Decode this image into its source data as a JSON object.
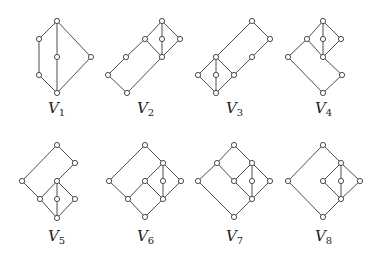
{
  "figure": {
    "width": 378,
    "height": 257,
    "colors": {
      "line": "#3a3a3a",
      "node_fill": "#ffffff",
      "text": "#222222"
    },
    "node_radius": 2.6,
    "lattices": [
      {
        "name": "V1",
        "label_main": "V",
        "label_sub": "1",
        "label_pos": [
          48,
          113
        ],
        "nodes": [
          [
            57,
            21
          ],
          [
            39,
            39
          ],
          [
            57,
            57
          ],
          [
            91,
            57
          ],
          [
            39,
            75
          ],
          [
            57,
            93
          ]
        ],
        "edges": [
          [
            0,
            1
          ],
          [
            0,
            2
          ],
          [
            0,
            3
          ],
          [
            1,
            4
          ],
          [
            4,
            5
          ],
          [
            2,
            5
          ],
          [
            3,
            5
          ]
        ]
      },
      {
        "name": "V2",
        "label_main": "V",
        "label_sub": "2",
        "label_pos": [
          137,
          113
        ],
        "nodes": [
          [
            162,
            21
          ],
          [
            145,
            39
          ],
          [
            162,
            39
          ],
          [
            180,
            39
          ],
          [
            162,
            57
          ],
          [
            126,
            57
          ],
          [
            108,
            75
          ],
          [
            127,
            93
          ]
        ],
        "edges": [
          [
            0,
            1
          ],
          [
            0,
            2
          ],
          [
            0,
            3
          ],
          [
            1,
            4
          ],
          [
            2,
            4
          ],
          [
            3,
            4
          ],
          [
            1,
            5
          ],
          [
            5,
            6
          ],
          [
            6,
            7
          ],
          [
            4,
            7
          ]
        ]
      },
      {
        "name": "V3",
        "label_main": "V",
        "label_sub": "3",
        "label_pos": [
          226,
          113
        ],
        "nodes": [
          [
            252,
            21
          ],
          [
            270,
            39
          ],
          [
            252,
            57
          ],
          [
            216,
            57
          ],
          [
            198,
            75
          ],
          [
            216,
            75
          ],
          [
            234,
            75
          ],
          [
            216,
            93
          ]
        ],
        "edges": [
          [
            0,
            1
          ],
          [
            1,
            2
          ],
          [
            2,
            6
          ],
          [
            0,
            3
          ],
          [
            3,
            4
          ],
          [
            3,
            5
          ],
          [
            3,
            6
          ],
          [
            4,
            7
          ],
          [
            5,
            7
          ],
          [
            6,
            7
          ]
        ]
      },
      {
        "name": "V4",
        "label_main": "V",
        "label_sub": "4",
        "label_pos": [
          315,
          113
        ],
        "nodes": [
          [
            323,
            21
          ],
          [
            307,
            39
          ],
          [
            323,
            39
          ],
          [
            341,
            39
          ],
          [
            323,
            57
          ],
          [
            288,
            57
          ],
          [
            342,
            75
          ],
          [
            323,
            93
          ]
        ],
        "edges": [
          [
            0,
            1
          ],
          [
            0,
            2
          ],
          [
            0,
            3
          ],
          [
            1,
            4
          ],
          [
            2,
            4
          ],
          [
            3,
            4
          ],
          [
            1,
            5
          ],
          [
            5,
            7
          ],
          [
            4,
            6
          ],
          [
            6,
            7
          ]
        ]
      },
      {
        "name": "V5",
        "label_main": "V",
        "label_sub": "5",
        "label_pos": [
          48,
          241
        ],
        "nodes": [
          [
            57,
            145
          ],
          [
            75,
            163
          ],
          [
            22,
            181
          ],
          [
            57,
            181
          ],
          [
            40,
            199
          ],
          [
            57,
            199
          ],
          [
            75,
            199
          ],
          [
            57,
            218
          ]
        ],
        "edges": [
          [
            0,
            1
          ],
          [
            0,
            2
          ],
          [
            1,
            3
          ],
          [
            2,
            4
          ],
          [
            3,
            4
          ],
          [
            3,
            5
          ],
          [
            3,
            6
          ],
          [
            4,
            7
          ],
          [
            5,
            7
          ],
          [
            6,
            7
          ]
        ]
      },
      {
        "name": "V6",
        "label_main": "V",
        "label_sub": "6",
        "label_pos": [
          137,
          241
        ],
        "nodes": [
          [
            145,
            145
          ],
          [
            163,
            163
          ],
          [
            109,
            181
          ],
          [
            145,
            181
          ],
          [
            163,
            181
          ],
          [
            181,
            181
          ],
          [
            128,
            199
          ],
          [
            163,
            199
          ],
          [
            145,
            217
          ]
        ],
        "edges": [
          [
            0,
            1
          ],
          [
            0,
            2
          ],
          [
            1,
            3
          ],
          [
            1,
            4
          ],
          [
            1,
            5
          ],
          [
            2,
            6
          ],
          [
            3,
            6
          ],
          [
            3,
            7
          ],
          [
            4,
            7
          ],
          [
            5,
            7
          ],
          [
            6,
            8
          ],
          [
            7,
            8
          ]
        ]
      },
      {
        "name": "V7",
        "label_main": "V",
        "label_sub": "7",
        "label_pos": [
          226,
          241
        ],
        "nodes": [
          [
            234,
            145
          ],
          [
            217,
            163
          ],
          [
            252,
            163
          ],
          [
            198,
            181
          ],
          [
            234,
            181
          ],
          [
            252,
            181
          ],
          [
            270,
            181
          ],
          [
            252,
            199
          ],
          [
            234,
            217
          ]
        ],
        "edges": [
          [
            0,
            1
          ],
          [
            0,
            2
          ],
          [
            1,
            3
          ],
          [
            1,
            4
          ],
          [
            2,
            4
          ],
          [
            2,
            5
          ],
          [
            2,
            6
          ],
          [
            4,
            7
          ],
          [
            5,
            7
          ],
          [
            6,
            7
          ],
          [
            3,
            8
          ],
          [
            7,
            8
          ]
        ]
      },
      {
        "name": "V8",
        "label_main": "V",
        "label_sub": "8",
        "label_pos": [
          315,
          241
        ],
        "nodes": [
          [
            323,
            145
          ],
          [
            341,
            163
          ],
          [
            288,
            181
          ],
          [
            323,
            181
          ],
          [
            341,
            181
          ],
          [
            360,
            181
          ],
          [
            341,
            199
          ],
          [
            323,
            217
          ]
        ],
        "edges": [
          [
            0,
            1
          ],
          [
            0,
            2
          ],
          [
            1,
            3
          ],
          [
            1,
            4
          ],
          [
            1,
            5
          ],
          [
            3,
            6
          ],
          [
            4,
            6
          ],
          [
            5,
            6
          ],
          [
            2,
            7
          ],
          [
            6,
            7
          ]
        ]
      }
    ]
  }
}
